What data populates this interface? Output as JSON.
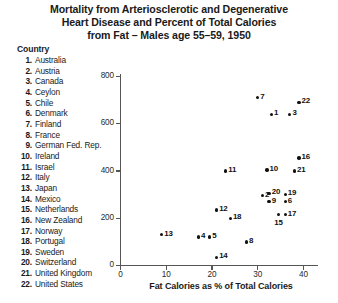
{
  "title": {
    "line1": "Mortality from Arteriosclerotic and Degenerative",
    "line2": "Heart Disease and Percent of Total Calories",
    "line3": "from Fat – Males age 55–59, 1950"
  },
  "legend": {
    "heading": "Country",
    "items": [
      {
        "num": "1.",
        "label": "Australia"
      },
      {
        "num": "2.",
        "label": "Austria"
      },
      {
        "num": "3.",
        "label": "Canada"
      },
      {
        "num": "4.",
        "label": "Ceylon"
      },
      {
        "num": "5.",
        "label": "Chile"
      },
      {
        "num": "6.",
        "label": "Denmark"
      },
      {
        "num": "7.",
        "label": "Finland"
      },
      {
        "num": "8.",
        "label": "France"
      },
      {
        "num": "9.",
        "label": "German Fed. Rep."
      },
      {
        "num": "10.",
        "label": "Ireland"
      },
      {
        "num": "11.",
        "label": "Israel"
      },
      {
        "num": "12.",
        "label": "Italy"
      },
      {
        "num": "13.",
        "label": "Japan"
      },
      {
        "num": "14.",
        "label": "Mexico"
      },
      {
        "num": "15.",
        "label": "Netherlands"
      },
      {
        "num": "16.",
        "label": "New Zealand"
      },
      {
        "num": "17.",
        "label": "Norway"
      },
      {
        "num": "18.",
        "label": "Portugal"
      },
      {
        "num": "19.",
        "label": "Sweden"
      },
      {
        "num": "20.",
        "label": "Switzerland"
      },
      {
        "num": "21.",
        "label": "United Kingdom"
      },
      {
        "num": "22.",
        "label": "United States"
      }
    ]
  },
  "chart_data": {
    "type": "scatter",
    "title": "Mortality from Arteriosclerotic and Degenerative Heart Disease and Percent of Total Calories from Fat – Males age 55–59, 1950",
    "xlabel": "Fat Calories as % of Total Calories",
    "ylabel": "",
    "xlim": [
      0,
      43
    ],
    "ylim": [
      0,
      820
    ],
    "xticks": [
      0,
      10,
      20,
      30,
      40
    ],
    "yticks": [
      0,
      200,
      400,
      600,
      800
    ],
    "grid": false,
    "legend_position": "top-left",
    "points": [
      {
        "id": 1,
        "name": "Australia",
        "x": 33.0,
        "y": 640,
        "label_pos": "right"
      },
      {
        "id": 2,
        "name": "Austria",
        "x": 31.0,
        "y": 295,
        "label_pos": "right"
      },
      {
        "id": 3,
        "name": "Canada",
        "x": 37.0,
        "y": 640,
        "label_pos": "right"
      },
      {
        "id": 4,
        "name": "Ceylon",
        "x": 17.0,
        "y": 120,
        "label_pos": "right"
      },
      {
        "id": 5,
        "name": "Chile",
        "x": 19.5,
        "y": 120,
        "label_pos": "right"
      },
      {
        "id": 6,
        "name": "Denmark",
        "x": 36.0,
        "y": 270,
        "label_pos": "right"
      },
      {
        "id": 7,
        "name": "Finland",
        "x": 30.0,
        "y": 710,
        "label_pos": "right"
      },
      {
        "id": 8,
        "name": "France",
        "x": 27.5,
        "y": 100,
        "label_pos": "right"
      },
      {
        "id": 9,
        "name": "German Fed. Rep.",
        "x": 32.5,
        "y": 270,
        "label_pos": "right"
      },
      {
        "id": 10,
        "name": "Ireland",
        "x": 32.0,
        "y": 405,
        "label_pos": "right"
      },
      {
        "id": 11,
        "name": "Israel",
        "x": 23.0,
        "y": 400,
        "label_pos": "right"
      },
      {
        "id": 12,
        "name": "Italy",
        "x": 21.0,
        "y": 235,
        "label_pos": "right"
      },
      {
        "id": 13,
        "name": "Japan",
        "x": 9.0,
        "y": 130,
        "label_pos": "right"
      },
      {
        "id": 14,
        "name": "Mexico",
        "x": 21.0,
        "y": 35,
        "label_pos": "right"
      },
      {
        "id": 15,
        "name": "Netherlands",
        "x": 34.5,
        "y": 215,
        "label_pos": "below"
      },
      {
        "id": 16,
        "name": "New Zealand",
        "x": 39.0,
        "y": 455,
        "label_pos": "right"
      },
      {
        "id": 17,
        "name": "Norway",
        "x": 36.0,
        "y": 215,
        "label_pos": "right"
      },
      {
        "id": 18,
        "name": "Portugal",
        "x": 24.0,
        "y": 200,
        "label_pos": "right"
      },
      {
        "id": 19,
        "name": "Sweden",
        "x": 36.0,
        "y": 300,
        "label_pos": "right"
      },
      {
        "id": 20,
        "name": "Switzerland",
        "x": 32.5,
        "y": 305,
        "label_pos": "right"
      },
      {
        "id": 21,
        "name": "United Kingdom",
        "x": 38.0,
        "y": 400,
        "label_pos": "right"
      },
      {
        "id": 22,
        "name": "United States",
        "x": 39.0,
        "y": 690,
        "label_pos": "right"
      }
    ]
  }
}
